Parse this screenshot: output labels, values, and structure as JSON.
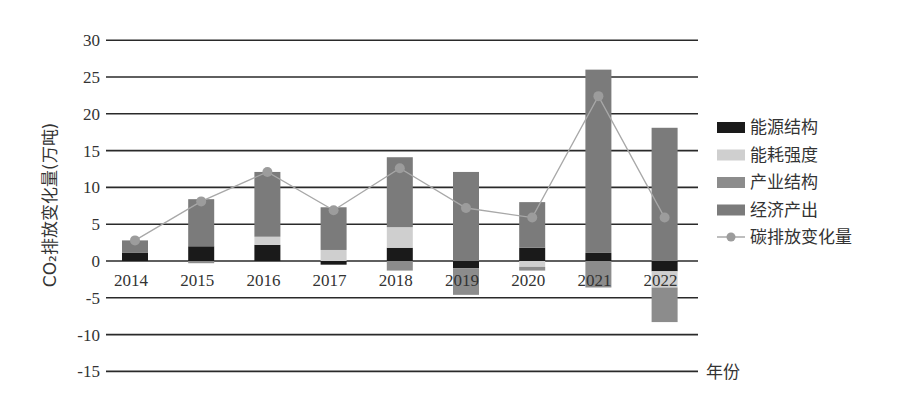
{
  "chart_data": {
    "type": "bar",
    "stacked": true,
    "title": "",
    "xlabel": "年份",
    "ylabel": "CO₂排放变化量(万吨)",
    "ylim": [
      -15,
      30
    ],
    "yticks": [
      30,
      25,
      20,
      15,
      10,
      5,
      0,
      -5,
      -10,
      -15
    ],
    "grid": true,
    "legend_position": "right",
    "categories": [
      "2014",
      "2015",
      "2016",
      "2017",
      "2018",
      "2019",
      "2020",
      "2021",
      "2022"
    ],
    "series": [
      {
        "name": "能源结构",
        "type": "bar",
        "color": "#1a1a1a",
        "values": [
          1.1,
          2.0,
          2.2,
          -0.5,
          1.8,
          -1.0,
          1.8,
          1.1,
          -1.4
        ]
      },
      {
        "name": "能耗强度",
        "type": "bar",
        "color": "#cfcfcf",
        "values": [
          0.0,
          0.0,
          1.1,
          1.5,
          2.8,
          0.0,
          -0.8,
          0.0,
          -2.2
        ]
      },
      {
        "name": "产业结构",
        "type": "bar",
        "color": "#8c8c8c",
        "values": [
          0.0,
          -0.3,
          0.0,
          0.0,
          -1.3,
          -3.6,
          -0.5,
          -3.6,
          -4.7
        ]
      },
      {
        "name": "经济产出",
        "type": "bar",
        "color": "#7b7b7b",
        "values": [
          1.7,
          6.4,
          8.8,
          5.8,
          9.5,
          12.1,
          6.2,
          24.9,
          18.1
        ]
      },
      {
        "name": "碳排放变化量",
        "type": "line",
        "color": "#a8a8a8",
        "values": [
          2.8,
          8.1,
          12.1,
          6.9,
          12.6,
          7.2,
          5.9,
          22.4,
          5.9
        ]
      }
    ]
  },
  "labels": {
    "ylabel": "CO₂排放变化量(万吨)",
    "xlabel": "年份"
  }
}
